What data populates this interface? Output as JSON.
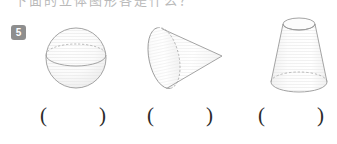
{
  "page": {
    "background_color": "#ffffff",
    "clipped_header_text": "下面的立体图形各是什么？"
  },
  "question": {
    "number": "5",
    "badge_color": "#8e8e8e",
    "badge_text_color": "#ffffff"
  },
  "figures": [
    {
      "id": "sphere",
      "icon": "sphere-icon",
      "label": "",
      "outline_color": "#9a9a9a",
      "fill_color": "#fafafa",
      "hidden_edge_style": "dashed"
    },
    {
      "id": "cone",
      "icon": "cone-icon",
      "label": "",
      "outline_color": "#9a9a9a",
      "fill_color": "#fafafa",
      "hidden_edge_style": "dashed"
    },
    {
      "id": "frustum",
      "icon": "frustum-icon",
      "label": "",
      "outline_color": "#9a9a9a",
      "fill_color": "#fafafa",
      "hidden_edge_style": "dashed"
    }
  ],
  "answers": {
    "open_paren": "(",
    "close_paren": ")",
    "slots": [
      {
        "id": "answer-1",
        "value": "",
        "placeholder": ""
      },
      {
        "id": "answer-2",
        "value": "",
        "placeholder": ""
      },
      {
        "id": "answer-3",
        "value": "",
        "placeholder": ""
      }
    ]
  }
}
